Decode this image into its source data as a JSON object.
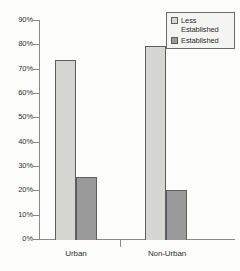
{
  "chart_data": {
    "type": "bar",
    "title": "",
    "subtitle": "",
    "xlabel": "",
    "ylabel": "",
    "categories": [
      "Urban",
      "Non-Urban"
    ],
    "series": [
      {
        "name": "Less\nEstablished",
        "legend_label": "Less\nEstablished",
        "values": [
          73.5,
          79.5
        ],
        "color": "#d6d6d2"
      },
      {
        "name": "Established",
        "legend_label": "Established",
        "values": [
          25.5,
          20.0
        ],
        "color": "#9a9a9a"
      }
    ],
    "ylim": [
      0,
      90
    ],
    "ytick_values": [
      0,
      10,
      20,
      30,
      40,
      50,
      60,
      70,
      80,
      90
    ],
    "ytick_labels": [
      "0%",
      "10%",
      "20%",
      "30%",
      "40%",
      "50%",
      "60%",
      "70%",
      "80%",
      "90%"
    ],
    "grid": false,
    "legend_position": "top-right",
    "annotations": []
  },
  "legend": {
    "items": [
      {
        "label": "Less\nEstablished",
        "color": "#d6d6d2"
      },
      {
        "label": "Established",
        "color": "#9a9a9a"
      }
    ]
  },
  "axis": {
    "y_labels": [
      "90%",
      "80%",
      "70%",
      "60%",
      "50%",
      "40%",
      "30%",
      "20%",
      "10%",
      "0%"
    ],
    "x_labels": [
      "Urban",
      "Non-Urban"
    ]
  },
  "colors": {
    "less_established": "#d6d6d2",
    "established": "#9a9a9a",
    "bar_outline": "#5e5e5c",
    "axis": "#8a8a88",
    "text": "#2f2f2f",
    "background": "#fdfdfc",
    "legend_background": "#f4f4f2"
  }
}
